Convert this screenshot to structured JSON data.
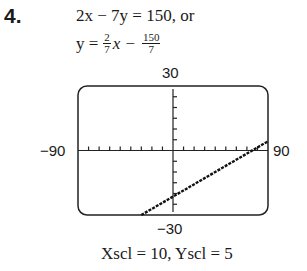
{
  "problem_number": "4.",
  "equation_line1": "2x − 7y = 150, or",
  "equation_line2": {
    "lhs": "y =",
    "frac1_num": "2",
    "frac1_den": "7",
    "var": "x",
    "op": "−",
    "frac2_num": "150",
    "frac2_den": "7"
  },
  "window": {
    "ymax_label": "30",
    "ymin_label": "−30",
    "xmin_label": "−90",
    "xmax_label": "90",
    "scale_text": "Xscl = 10, Yscl = 5"
  },
  "chart_data": {
    "type": "line",
    "equation": "2x − 7y = 150",
    "xlim": [
      -90,
      90
    ],
    "ylim": [
      -30,
      30
    ],
    "xscl": 10,
    "yscl": 5,
    "grid": false,
    "series": [
      {
        "name": "y = 2/7 x − 150/7",
        "x": [
          -30,
          0,
          52.5,
          90
        ],
        "y": [
          -30,
          -21.43,
          -6.43,
          4.29
        ]
      }
    ],
    "tick_labels": {
      "xmin": "−90",
      "xmax": "90",
      "ymin": "−30",
      "ymax": "30"
    },
    "footer": "Xscl = 10, Yscl = 5"
  }
}
